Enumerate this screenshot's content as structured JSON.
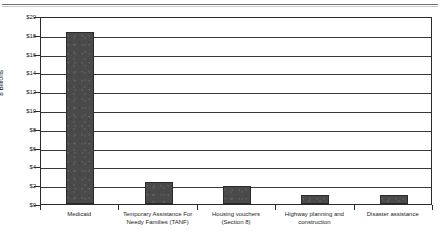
{
  "chart_data": {
    "type": "bar",
    "title": "",
    "subtitle": "",
    "xlabel": "",
    "ylabel": "$ Billions",
    "ylim": [
      0,
      20
    ],
    "ytick_step": 2,
    "grid": true,
    "legend": null,
    "bar_color": "#4a4a4a",
    "categories": [
      "Medicaid",
      "Temporary Assistance For Needy Families (TANF)",
      "Housing vouchers (Section 8)",
      "Highway planning and construction",
      "Disaster assistance"
    ],
    "category_lines": [
      [
        "Medicaid"
      ],
      [
        "Temporary Assistance For",
        "Needy Families (TANF)"
      ],
      [
        "Housing vouchers",
        "(Section 8)"
      ],
      [
        "Highway planning and",
        "construction"
      ],
      [
        "Disaster assistance"
      ]
    ],
    "values": [
      18.3,
      2.3,
      1.9,
      1.0,
      1.0
    ],
    "ytick_labels": [
      "$0",
      "$2",
      "$4",
      "$6",
      "$8",
      "$10",
      "$12",
      "$14",
      "$16",
      "$18",
      "$20"
    ],
    "ytick_values": [
      0,
      2,
      4,
      6,
      8,
      10,
      12,
      14,
      16,
      18,
      20
    ]
  }
}
